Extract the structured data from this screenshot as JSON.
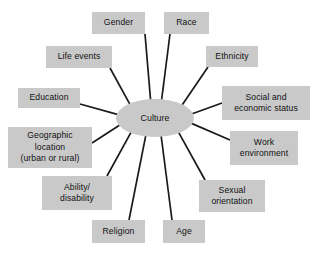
{
  "diagram": {
    "type": "radial-spoke-diagram",
    "background_color": "#ffffff",
    "node_fill_color": "#c9c9c9",
    "node_text_color": "#111111",
    "spoke_line_color": "#1a1a1a",
    "center": {
      "label": "Culture",
      "shape": "ellipse",
      "cx": 155,
      "cy": 118,
      "rx": 39,
      "ry": 19
    },
    "nodes": [
      {
        "id": "gender",
        "label": "Gender",
        "x": 92,
        "y": 12,
        "w": 53,
        "h": 22,
        "anchor_x": 145,
        "anchor_y": 34
      },
      {
        "id": "race",
        "label": "Race",
        "x": 164,
        "y": 12,
        "w": 45,
        "h": 22,
        "anchor_x": 170,
        "anchor_y": 34
      },
      {
        "id": "ethnicity",
        "label": "Ethnicity",
        "x": 206,
        "y": 46,
        "w": 52,
        "h": 21,
        "anchor_x": 208,
        "anchor_y": 67
      },
      {
        "id": "social",
        "label": "Social and\neconomic status",
        "x": 222,
        "y": 86,
        "w": 88,
        "h": 34,
        "anchor_x": 222,
        "anchor_y": 103
      },
      {
        "id": "work",
        "label": "Work\nenvironment",
        "x": 230,
        "y": 131,
        "w": 68,
        "h": 34,
        "anchor_x": 230,
        "anchor_y": 140
      },
      {
        "id": "sexual",
        "label": "Sexual\norientation",
        "x": 199,
        "y": 180,
        "w": 66,
        "h": 32,
        "anchor_x": 205,
        "anchor_y": 180
      },
      {
        "id": "age",
        "label": "Age",
        "x": 163,
        "y": 220,
        "w": 42,
        "h": 23,
        "anchor_x": 172,
        "anchor_y": 220
      },
      {
        "id": "religion",
        "label": "Religion",
        "x": 92,
        "y": 220,
        "w": 53,
        "h": 23,
        "anchor_x": 129,
        "anchor_y": 220
      },
      {
        "id": "ability",
        "label": "Ability/\ndisability",
        "x": 42,
        "y": 176,
        "w": 70,
        "h": 34,
        "anchor_x": 107,
        "anchor_y": 176
      },
      {
        "id": "geographic",
        "label": "Geographic\nlocation\n(urban or rural)",
        "x": 8,
        "y": 127,
        "w": 84,
        "h": 41,
        "anchor_x": 92,
        "anchor_y": 143
      },
      {
        "id": "education",
        "label": "Education",
        "x": 18,
        "y": 88,
        "w": 62,
        "h": 20,
        "anchor_x": 80,
        "anchor_y": 104
      },
      {
        "id": "lifeevents",
        "label": "Life events",
        "x": 46,
        "y": 46,
        "w": 66,
        "h": 22,
        "anchor_x": 110,
        "anchor_y": 68
      }
    ]
  }
}
